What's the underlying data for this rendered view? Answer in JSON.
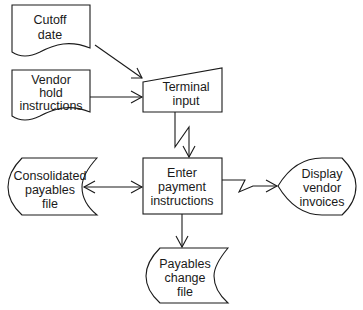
{
  "diagram": {
    "type": "system-flowchart",
    "nodes": [
      {
        "id": "cutoff",
        "shape": "document",
        "lines": [
          "Cutoff",
          "date"
        ]
      },
      {
        "id": "vendor-hold",
        "shape": "document",
        "lines": [
          "Vendor",
          "hold",
          "instructions"
        ]
      },
      {
        "id": "terminal",
        "shape": "manual-input",
        "lines": [
          "Terminal",
          "input"
        ]
      },
      {
        "id": "enter-payment",
        "shape": "process",
        "lines": [
          "Enter",
          "payment",
          "instructions"
        ]
      },
      {
        "id": "consolidated",
        "shape": "stored-data",
        "lines": [
          "Consolidated",
          "payables",
          "file"
        ]
      },
      {
        "id": "display",
        "shape": "display",
        "lines": [
          "Display",
          "vendor",
          "invoices"
        ]
      },
      {
        "id": "change-file",
        "shape": "stored-data",
        "lines": [
          "Payables",
          "change",
          "file"
        ]
      }
    ],
    "edges": [
      {
        "from": "cutoff",
        "to": "terminal",
        "style": "arrow"
      },
      {
        "from": "vendor-hold",
        "to": "terminal",
        "style": "arrow"
      },
      {
        "from": "terminal",
        "to": "enter-payment",
        "style": "communication-link"
      },
      {
        "from": "consolidated",
        "to": "enter-payment",
        "style": "bidirectional"
      },
      {
        "from": "enter-payment",
        "to": "display",
        "style": "communication-link"
      },
      {
        "from": "enter-payment",
        "to": "change-file",
        "style": "arrow"
      }
    ]
  }
}
